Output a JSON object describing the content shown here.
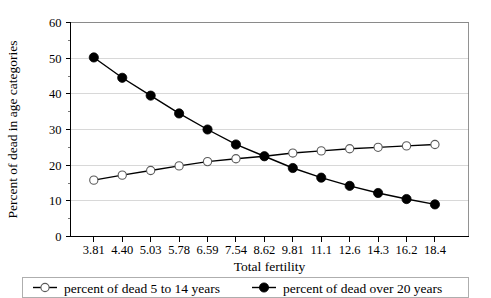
{
  "chart_data": {
    "type": "line",
    "title": "",
    "xlabel": "Total fertility",
    "ylabel": "Percent of dead in age categories",
    "categories": [
      "3.81",
      "4.40",
      "5.03",
      "5.78",
      "6.59",
      "7.54",
      "8.62",
      "9.81",
      "11.1",
      "12.6",
      "14.3",
      "16.2",
      "18.4"
    ],
    "ylim": [
      0,
      60
    ],
    "yticks": [
      0,
      10,
      20,
      30,
      40,
      50,
      60
    ],
    "ytick_labels": [
      "0",
      "10",
      "20",
      "30",
      "40",
      "50",
      "60"
    ],
    "grid": true,
    "legend_position": "bottom",
    "series": [
      {
        "name": "percent of dead 5 to 14 years",
        "marker": "open-circle",
        "values": [
          15.8,
          17.2,
          18.5,
          19.8,
          21.0,
          21.8,
          22.5,
          23.4,
          24.0,
          24.6,
          25.0,
          25.4,
          25.8
        ]
      },
      {
        "name": "percent of dead over 20 years",
        "marker": "filled-circle",
        "values": [
          50.2,
          44.5,
          39.5,
          34.5,
          30.0,
          25.8,
          22.5,
          19.2,
          16.5,
          14.2,
          12.2,
          10.5,
          9.0
        ]
      }
    ]
  },
  "legend": {
    "entries": [
      {
        "label": "percent of dead 5 to 14 years",
        "marker": "open-circle"
      },
      {
        "label": "percent of dead over 20 years",
        "marker": "filled-circle"
      }
    ]
  },
  "colors": {
    "ink": "#000000",
    "grid": "#c8c8c8",
    "frame": "#777777",
    "marker_open_stroke": "#5a5a5a",
    "background": "#ffffff"
  }
}
